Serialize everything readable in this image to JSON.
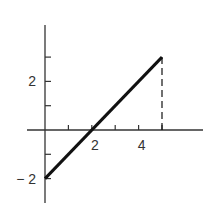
{
  "chart_data": {
    "type": "line",
    "title": "",
    "xlabel": "",
    "ylabel": "",
    "x_ticks": [
      1,
      2,
      3,
      4,
      5
    ],
    "x_tick_labels": [
      {
        "value": 2,
        "label": "2"
      },
      {
        "value": 4,
        "label": "4"
      }
    ],
    "y_ticks": [
      -2,
      -1,
      1,
      2,
      3
    ],
    "y_tick_labels": [
      {
        "value": 2,
        "label": "2"
      },
      {
        "value": -2,
        "label": "-2"
      }
    ],
    "xlim": [
      0,
      6.6
    ],
    "ylim": [
      -3,
      4.4
    ],
    "grid": false,
    "series": [
      {
        "name": "line",
        "style": "solid",
        "x": [
          0,
          5
        ],
        "y": [
          -2,
          3
        ]
      },
      {
        "name": "drop-line",
        "style": "dashed",
        "x": [
          5,
          5
        ],
        "y": [
          3,
          0
        ]
      }
    ],
    "colors": {
      "line": "#111111",
      "axis": "#333333"
    }
  }
}
